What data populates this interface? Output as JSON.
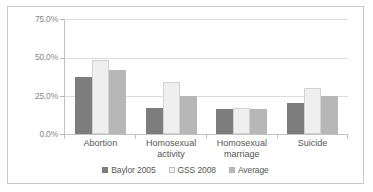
{
  "chart_data": {
    "type": "bar",
    "title": "",
    "subtitle": "",
    "xlabel": "",
    "ylabel": "",
    "categories": [
      "Abortion",
      "Homosexual activity",
      "Homosexual marriage",
      "Suicide"
    ],
    "series": [
      {
        "name": "Baylor 2005",
        "color": "#7d7d7d",
        "values": [
          37.0,
          17.0,
          16.0,
          20.0
        ]
      },
      {
        "name": "GSS 2008",
        "color": "#efefef",
        "values": [
          48.0,
          34.0,
          17.0,
          30.0
        ]
      },
      {
        "name": "Average",
        "color": "#b7b7b7",
        "values": [
          41.5,
          25.0,
          16.5,
          25.0
        ]
      }
    ],
    "ylim": [
      0,
      75
    ],
    "yticks": [
      0,
      25,
      50,
      75
    ],
    "ytick_labels": [
      "0.0%",
      "25.0%",
      "50.0%",
      "75.0%"
    ],
    "grid": true,
    "legend_position": "bottom",
    "legend_entries": [
      "Baylor 2005",
      "GSS 2008",
      "Average"
    ],
    "annotations": []
  },
  "axis": {
    "ytick_labels": [
      "75.0%",
      "50.0%",
      "25.0%",
      "0.0%"
    ]
  },
  "categories": {
    "c0_line1": "Abortion",
    "c0_line2": "",
    "c1_line1": "Homosexual",
    "c1_line2": "activity",
    "c2_line1": "Homosexual",
    "c2_line2": "marriage",
    "c3_line1": "Suicide",
    "c3_line2": ""
  },
  "legend": {
    "items": [
      {
        "label": "Baylor 2005"
      },
      {
        "label": "GSS 2008"
      },
      {
        "label": "Average"
      }
    ]
  }
}
